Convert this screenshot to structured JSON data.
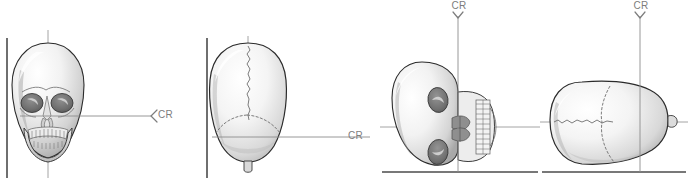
{
  "figure": {
    "background_color": "#ffffff",
    "width": 688,
    "height": 183,
    "line_colors": {
      "image_receptor": "#4b4b4b",
      "alignment_line": "#9a9a9a",
      "beam_line": "#8c8c8c",
      "bone_outline": "#2b2b2b",
      "suture": "#6e6e6e",
      "label_text": "#7d7d7d"
    }
  },
  "panels": [
    {
      "id": "panel-1",
      "view_name": "anterior-skull-view",
      "description": "Anterior (frontal) view of skull against a vertical image receptor",
      "cr_label": "CR",
      "cr_direction": "horizontal-left",
      "receptor_orientation": "vertical",
      "has_vertical_alignment_line": true,
      "has_horizontal_alignment_line": true
    },
    {
      "id": "panel-2",
      "view_name": "vertex-skull-view",
      "description": "Superior vertex view of skull against a vertical image receptor",
      "cr_label": "CR",
      "cr_direction": "horizontal-left",
      "receptor_orientation": "vertical",
      "has_vertical_alignment_line": true,
      "has_horizontal_alignment_line": true
    },
    {
      "id": "panel-3",
      "view_name": "rotated-anterior-skull-view",
      "description": "Skull rotated 90 degrees lying on a horizontal image receptor, anterior aspect facing right",
      "cr_label": "CR",
      "cr_direction": "vertical-down",
      "receptor_orientation": "horizontal",
      "has_vertical_alignment_line": true,
      "has_horizontal_alignment_line": true
    },
    {
      "id": "panel-4",
      "view_name": "rotated-vertex-skull-view",
      "description": "Cranial vertex rotated 90 degrees lying on a horizontal image receptor",
      "cr_label": "CR",
      "cr_direction": "vertical-down",
      "receptor_orientation": "horizontal",
      "has_vertical_alignment_line": true,
      "has_horizontal_alignment_line": true
    }
  ]
}
